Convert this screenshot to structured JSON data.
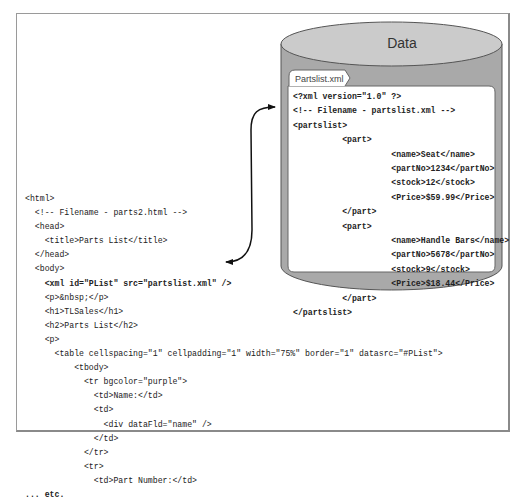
{
  "database": {
    "title": "Data",
    "fill_color": "#c8c8c8",
    "side_color": "#a8a8a8",
    "outline_color": "#555555"
  },
  "xml_file": {
    "tab_label": "Partslist.xml",
    "lines": [
      "<?xml version=\"1.0\" ?>",
      "<!-- Filename - partslist.xml -->",
      "<partslist>",
      "          <part>",
      "                    <name>Seat</name>",
      "                    <partNo>1234</partNo>",
      "                    <stock>12</stock>",
      "                    <Price>$59.99</Price>",
      "          </part>",
      "          <part>",
      "                    <name>Handle Bars</name>",
      "                    <partNo>5678</partNo>",
      "                    <stock>9</stock>",
      "                    <Price>$18.44</Price>",
      "          </part>",
      "</partslist>"
    ]
  },
  "html_file": {
    "lines": [
      "<html>",
      "  <!-- Filename - parts2.html -->",
      "  <head>",
      "    <title>Parts List</title>",
      "  </head>",
      "  <body>",
      "    <xml id=\"PList\" src=\"partslist.xml\" />",
      "    <p>&nbsp;</p>",
      "    <h1>TLSales</h1>",
      "    <h2>Parts List</h2>",
      "    <p>",
      "      <table cellspacing=\"1\" cellpadding=\"1\" width=\"75%\" border=\"1\" datasrc=\"#PList\">",
      "          <tbody>",
      "            <tr bgcolor=\"purple\">",
      "              <td>Name:</td>",
      "              <td>",
      "                <div dataFld=\"name\" />",
      "              </td>",
      "            </tr>",
      "            <tr>",
      "              <td>Part Number:</td>",
      "... etc."
    ]
  },
  "connector": {
    "label": "link between xml data island and partslist.xml",
    "style": "double-headed curved arrow"
  }
}
